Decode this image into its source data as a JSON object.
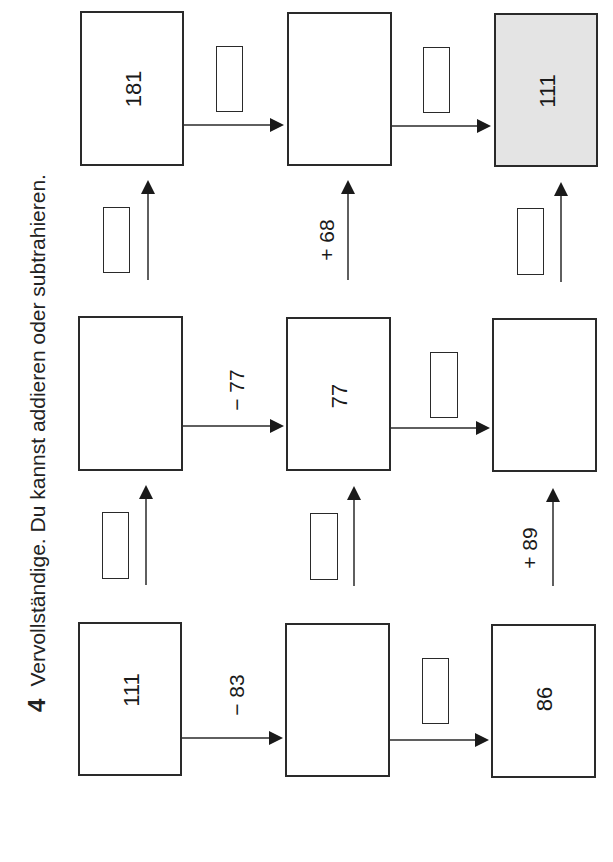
{
  "task": {
    "number": "4",
    "instruction": "Vervollständige. Du kannst addieren oder subtrahieren."
  },
  "rows": [
    {
      "boxes": [
        {
          "value": "181",
          "shaded": false
        },
        {
          "value": "",
          "shaded": false
        },
        {
          "value": "111",
          "shaded": true
        }
      ],
      "ops": [
        {
          "label": "",
          "blank": true
        },
        {
          "label": "",
          "blank": true
        }
      ]
    },
    {
      "boxes": [
        {
          "value": "",
          "shaded": false
        },
        {
          "value": "77",
          "shaded": false
        },
        {
          "value": "",
          "shaded": false
        }
      ],
      "ops": [
        {
          "label": "− 77",
          "blank": false
        },
        {
          "label": "",
          "blank": true
        }
      ]
    },
    {
      "boxes": [
        {
          "value": "111",
          "shaded": false
        },
        {
          "value": "",
          "shaded": false
        },
        {
          "value": "86",
          "shaded": false
        }
      ],
      "ops": [
        {
          "label": "− 83",
          "blank": false
        },
        {
          "label": "",
          "blank": true
        }
      ]
    }
  ],
  "column_ops": [
    {
      "between_rows": "2-1",
      "ops": [
        {
          "label": "",
          "blank": true
        },
        {
          "label": "+ 68",
          "blank": false
        },
        {
          "label": "",
          "blank": true
        }
      ]
    },
    {
      "between_rows": "3-2",
      "ops": [
        {
          "label": "",
          "blank": true
        },
        {
          "label": "",
          "blank": true
        },
        {
          "label": "+ 89",
          "blank": false
        }
      ]
    }
  ],
  "colors": {
    "line": "#2a2a2a",
    "shaded_fill": "#e4e4e4",
    "background": "#ffffff"
  }
}
